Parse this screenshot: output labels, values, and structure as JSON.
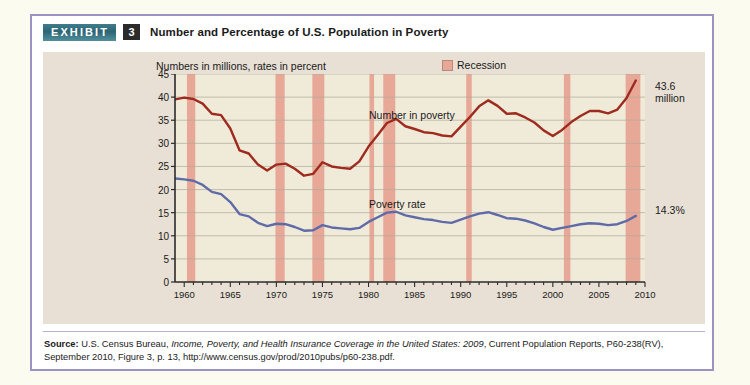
{
  "exhibit": {
    "badge_label": "EXHIBIT",
    "number": "3",
    "title": "Number and Percentage of U.S. Population in Poverty"
  },
  "chart_header": {
    "subtitle": "Numbers in millions, rates in percent",
    "legend_label": "Recession"
  },
  "annotations": {
    "number_end": "43.6\nmillion",
    "rate_end": "14.3%"
  },
  "series_labels": {
    "number": "Number in poverty",
    "rate": "Poverty rate"
  },
  "source": {
    "prefix": "Source:",
    "part1": " U.S. Census Bureau, ",
    "italic1": "Income, Poverty, and Health Insurance Coverage in the United States: 2009",
    "part2": ", Current Population Reports, P60-238(RV), September 2010, Figure 3, p. 13, http://www.census.gov/prod/2010pubs/p60-238.pdf."
  },
  "colors": {
    "number_line": "#9e2b1e",
    "rate_line": "#5f6ba8",
    "recession_band": "#e8a898",
    "plot_background": "#f0ead9",
    "panel_background": "#e8e0d4",
    "badge_teal": "#2d6574",
    "card_border": "#9a93c4"
  },
  "chart_data": {
    "type": "line",
    "title": "Number and Percentage of U.S. Population in Poverty",
    "subtitle": "Numbers in millions, rates in percent",
    "xlabel": "",
    "ylabel": "",
    "xlim": [
      1959,
      2010
    ],
    "ylim": [
      0,
      45
    ],
    "y_ticks": [
      0,
      5,
      10,
      15,
      20,
      25,
      30,
      35,
      40,
      45
    ],
    "x_ticks": [
      1960,
      1965,
      1970,
      1975,
      1980,
      1985,
      1990,
      1995,
      2000,
      2005,
      2010
    ],
    "x_minor_tick_step": 1,
    "grid": true,
    "legend_position": "top-right",
    "legend_entries": [
      "Recession"
    ],
    "x": [
      1959,
      1960,
      1961,
      1962,
      1963,
      1964,
      1965,
      1966,
      1967,
      1968,
      1969,
      1970,
      1971,
      1972,
      1973,
      1974,
      1975,
      1976,
      1977,
      1978,
      1979,
      1980,
      1981,
      1982,
      1983,
      1984,
      1985,
      1986,
      1987,
      1988,
      1989,
      1990,
      1991,
      1992,
      1993,
      1994,
      1995,
      1996,
      1997,
      1998,
      1999,
      2000,
      2001,
      2002,
      2003,
      2004,
      2005,
      2006,
      2007,
      2008,
      2009
    ],
    "series": [
      {
        "name": "Number in poverty",
        "unit": "millions",
        "color": "#9e2b1e",
        "end_value": 43.6,
        "end_label": "43.6 million",
        "values": [
          39.5,
          39.9,
          39.6,
          38.6,
          36.4,
          36.1,
          33.2,
          28.5,
          27.8,
          25.4,
          24.1,
          25.4,
          25.6,
          24.5,
          23.0,
          23.4,
          25.9,
          25.0,
          24.7,
          24.5,
          26.1,
          29.3,
          31.8,
          34.4,
          35.3,
          33.7,
          33.1,
          32.4,
          32.2,
          31.7,
          31.5,
          33.6,
          35.7,
          38.0,
          39.3,
          38.1,
          36.4,
          36.5,
          35.6,
          34.5,
          32.8,
          31.6,
          32.9,
          34.6,
          35.9,
          37.0,
          37.0,
          36.5,
          37.3,
          39.8,
          43.6
        ]
      },
      {
        "name": "Poverty rate",
        "unit": "percent",
        "color": "#5f6ba8",
        "end_value": 14.3,
        "end_label": "14.3%",
        "values": [
          22.4,
          22.2,
          21.9,
          21.0,
          19.5,
          19.0,
          17.3,
          14.7,
          14.2,
          12.8,
          12.1,
          12.6,
          12.5,
          11.9,
          11.1,
          11.2,
          12.3,
          11.8,
          11.6,
          11.4,
          11.7,
          13.0,
          14.0,
          15.0,
          15.2,
          14.4,
          14.0,
          13.6,
          13.4,
          13.0,
          12.8,
          13.5,
          14.2,
          14.8,
          15.1,
          14.5,
          13.8,
          13.7,
          13.3,
          12.7,
          11.9,
          11.3,
          11.7,
          12.1,
          12.5,
          12.7,
          12.6,
          12.3,
          12.5,
          13.2,
          14.3
        ]
      }
    ],
    "recession_bands": [
      {
        "start": 1960.3,
        "end": 1961.2
      },
      {
        "start": 1969.9,
        "end": 1970.9
      },
      {
        "start": 1973.9,
        "end": 1975.2
      },
      {
        "start": 1980.1,
        "end": 1980.6
      },
      {
        "start": 1981.6,
        "end": 1982.9
      },
      {
        "start": 1990.6,
        "end": 1991.2
      },
      {
        "start": 2001.2,
        "end": 2001.9
      },
      {
        "start": 2007.9,
        "end": 2009.5
      }
    ]
  }
}
